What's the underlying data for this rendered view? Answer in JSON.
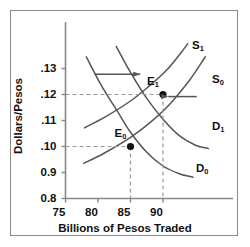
{
  "chart_data": {
    "type": "line",
    "title": "",
    "xlabel": "Billions of Pesos Traded",
    "ylabel": "Dollars/Pesos",
    "xlim": [
      73,
      97
    ],
    "ylim": [
      0.078,
      0.138
    ],
    "grid": false,
    "legend_position": "inline-curve-labels",
    "xticks": [
      "75",
      "80",
      "85",
      "90"
    ],
    "xtick_values": [
      75,
      80,
      85,
      90
    ],
    "yticks": [
      ".13",
      ".12",
      ".11",
      ".10",
      "0.9",
      "0.8"
    ],
    "ytick_values": [
      0.13,
      0.12,
      0.11,
      0.1,
      0.09,
      0.08
    ],
    "series": [
      {
        "name": "D0",
        "label": "D",
        "label_sub": "0",
        "kind": "demand",
        "points": [
          [
            78.2,
            0.1345
          ],
          [
            80.5,
            0.1235
          ],
          [
            83.0,
            0.1135
          ],
          [
            85.0,
            0.1055
          ],
          [
            87.5,
            0.0978
          ],
          [
            90.0,
            0.0925
          ],
          [
            92.5,
            0.0895
          ],
          [
            94.6,
            0.0882
          ]
        ]
      },
      {
        "name": "D1",
        "label": "D",
        "label_sub": "1",
        "kind": "demand",
        "points": [
          [
            82.8,
            0.1385
          ],
          [
            85.0,
            0.1285
          ],
          [
            87.5,
            0.1185
          ],
          [
            90.0,
            0.1105
          ],
          [
            92.5,
            0.1042
          ],
          [
            95.0,
            0.1005
          ],
          [
            97.0,
            0.0992
          ]
        ]
      },
      {
        "name": "S0",
        "label": "S",
        "label_sub": "0",
        "kind": "supply",
        "points": [
          [
            77.8,
            0.0935
          ],
          [
            81.0,
            0.0975
          ],
          [
            85.0,
            0.1035
          ],
          [
            88.0,
            0.1092
          ],
          [
            91.0,
            0.1162
          ],
          [
            94.0,
            0.1252
          ],
          [
            96.5,
            0.1345
          ]
        ]
      },
      {
        "name": "S1",
        "label": "S",
        "label_sub": "1",
        "kind": "supply",
        "points": [
          [
            77.9,
            0.1072
          ],
          [
            81.0,
            0.1112
          ],
          [
            85.0,
            0.1175
          ],
          [
            88.0,
            0.1235
          ],
          [
            90.5,
            0.1292
          ],
          [
            92.5,
            0.1352
          ],
          [
            93.8,
            0.1395
          ]
        ]
      }
    ],
    "equilibria": [
      {
        "name": "E0",
        "label": "E",
        "label_sub": "0",
        "x": 85,
        "y": 0.1
      },
      {
        "name": "E1",
        "label": "E",
        "label_sub": "1",
        "x": 90,
        "y": 0.12
      }
    ],
    "annotations": [
      {
        "name": "demand-shift-arrow",
        "direction": "right",
        "x_start": 79.5,
        "x_end": 86.5,
        "y": 0.1278
      },
      {
        "name": "supply-shift-arrow",
        "direction": "left",
        "x_start": 95.2,
        "x_end": 90.8,
        "y": 0.1192
      }
    ],
    "colors": {
      "curve": "#555555",
      "axis": "#888888",
      "text": "#111111",
      "marker": "#111111",
      "dashed": "#999999",
      "frame": "#8a8a8a",
      "background": "#ffffff"
    }
  }
}
